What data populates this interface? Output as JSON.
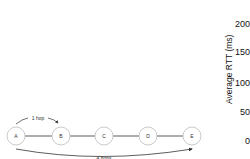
{
  "diagram": {
    "nodes": [
      {
        "id": "A",
        "label": "A",
        "cx": 16,
        "cy": 136
      },
      {
        "id": "B",
        "label": "B",
        "cx": 61,
        "cy": 136
      },
      {
        "id": "C",
        "label": "C",
        "cx": 104,
        "cy": 136
      },
      {
        "id": "D",
        "label": "D",
        "cx": 148,
        "cy": 136
      },
      {
        "id": "E",
        "label": "E",
        "cx": 192,
        "cy": 136
      }
    ],
    "arrows": [
      {
        "label": "1 hop",
        "from": "A",
        "to": "B"
      },
      {
        "label": "4 hops",
        "from": "A",
        "to": "E"
      }
    ]
  },
  "axis": {
    "title": "Average RTT (ms)",
    "ticks": [
      "200",
      "150",
      "100",
      "50",
      "0"
    ]
  },
  "colors": {
    "node_stroke": "#bbbbbb",
    "edge": "#333333",
    "text": "#111111"
  }
}
